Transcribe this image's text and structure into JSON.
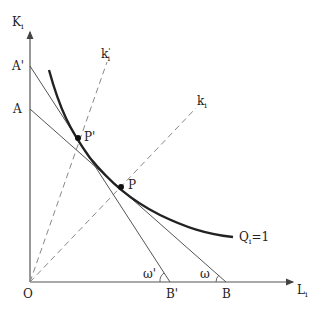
{
  "diagram": {
    "type": "isoquant-isocost",
    "axes": {
      "y_label": "K",
      "y_sub": "i",
      "x_label": "L",
      "x_sub": "i",
      "origin_label": "O"
    },
    "points": {
      "A_prime": "A'",
      "A": "A",
      "B_prime": "B'",
      "B": "B",
      "P_prime": "P'",
      "P": "P"
    },
    "rays": {
      "k_prime": {
        "label": "k",
        "sup": "'",
        "sub": "i"
      },
      "k": {
        "label": "k",
        "sub": "i"
      }
    },
    "isoquant": {
      "label": "Q",
      "sub": "i",
      "eq": "=1"
    },
    "angles": {
      "omega_prime": "ω'",
      "omega": "ω"
    },
    "colors": {
      "axis": "#555555",
      "line": "#555555",
      "curve": "#222222",
      "ray": "#888888"
    }
  }
}
